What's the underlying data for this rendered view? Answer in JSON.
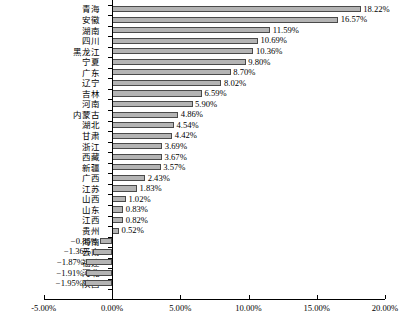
{
  "chart_data": {
    "type": "bar",
    "orientation": "horizontal",
    "title": "",
    "subtitle": "",
    "xlabel": "",
    "ylabel": "",
    "xlim": [
      -5.0,
      20.0
    ],
    "grid": false,
    "legend": null,
    "value_format": "percent",
    "xticks": [
      "-5.00%",
      "0.00%",
      "5.00%",
      "10.00%",
      "15.00%",
      "20.00%"
    ],
    "xtick_values": [
      -5.0,
      0.0,
      5.0,
      10.0,
      15.0,
      20.0
    ],
    "categories": [
      "青海",
      "安徽",
      "湖南",
      "四川",
      "黑龙江",
      "宁夏",
      "广东",
      "辽宁",
      "吉林",
      "河南",
      "内蒙古",
      "湖北",
      "甘肃",
      "浙江",
      "西藏",
      "新疆",
      "广西",
      "江苏",
      "山西",
      "山东",
      "江西",
      "贵州",
      "海南",
      "云南",
      "福建",
      "河北",
      "陕西"
    ],
    "values": [
      18.22,
      16.57,
      11.59,
      10.69,
      10.36,
      9.8,
      8.7,
      8.02,
      6.59,
      5.9,
      4.86,
      4.54,
      4.42,
      3.69,
      3.67,
      3.57,
      2.43,
      1.83,
      1.02,
      0.83,
      0.82,
      0.52,
      -0.85,
      -1.36,
      -1.87,
      -1.91,
      -1.95
    ],
    "data_labels": [
      "18.22%",
      "16.57%",
      "11.59%",
      "10.69%",
      "10.36%",
      "9.80%",
      "8.70%",
      "8.02%",
      "6.59%",
      "5.90%",
      "4.86%",
      "4.54%",
      "4.42%",
      "3.69%",
      "3.67%",
      "3.57%",
      "2.43%",
      "1.83%",
      "1.02%",
      "0.83%",
      "0.82%",
      "0.52%",
      "−0.85%",
      "−1.36%",
      "−1.87%",
      "−1.91%",
      "−1.95%"
    ],
    "bar_fill_color": "#b4b4b4",
    "bar_border_color": "#4a4a4a",
    "axis_color": "#000000"
  }
}
